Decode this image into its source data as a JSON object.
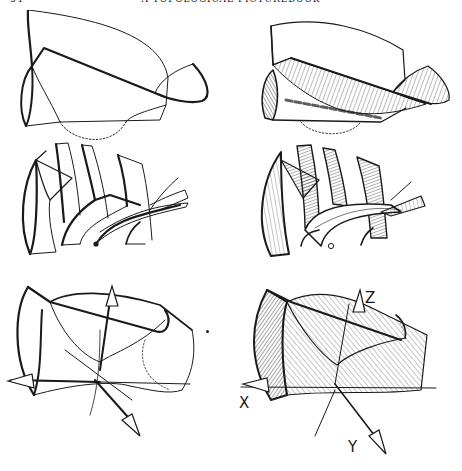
{
  "header": {
    "page_number": "54",
    "title": "A TOPOLOGICAL PICTUREBOOK"
  },
  "figures": [
    {
      "id": "fig-1",
      "position": "top-left",
      "style": "outline",
      "subject": "folded surface with loop"
    },
    {
      "id": "fig-2",
      "position": "top-right",
      "style": "shaded",
      "subject": "folded surface with loop"
    },
    {
      "id": "fig-3",
      "position": "middle-left",
      "style": "outline",
      "subject": "sliced ribbons"
    },
    {
      "id": "fig-4",
      "position": "middle-right",
      "style": "shaded",
      "subject": "sliced ribbons"
    },
    {
      "id": "fig-5",
      "position": "bottom-left",
      "style": "outline",
      "subject": "saddle surface with axes"
    },
    {
      "id": "fig-6",
      "position": "bottom-right",
      "style": "shaded",
      "subject": "saddle surface with axes",
      "axis_labels": {
        "x": "X",
        "y": "Y",
        "z": "Z"
      }
    }
  ],
  "colors": {
    "ink": "#1a1a1a",
    "paper": "#ffffff"
  }
}
